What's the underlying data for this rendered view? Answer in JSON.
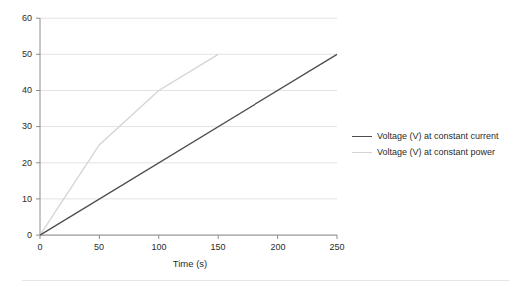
{
  "chart_data": {
    "type": "line",
    "title": "",
    "subtitle": "",
    "xlabel": "Time (s)",
    "ylabel": "",
    "xlim": [
      0,
      250
    ],
    "ylim": [
      0,
      60
    ],
    "xticks": [
      0,
      50,
      100,
      150,
      200,
      250
    ],
    "yticks": [
      0,
      10,
      20,
      30,
      40,
      50,
      60
    ],
    "grid": "horizontal",
    "legend_position": "right",
    "series": [
      {
        "name": "Voltage (V) at constant current",
        "color": "#4d4d4d",
        "x": [
          0,
          250
        ],
        "y": [
          0,
          50
        ]
      },
      {
        "name": "Voltage (V) at constant power",
        "color": "#d4d4d4",
        "x": [
          0,
          50,
          100,
          150
        ],
        "y": [
          0,
          25,
          40,
          50
        ]
      }
    ]
  },
  "axes": {
    "x_tick_labels": [
      "0",
      "50",
      "100",
      "150",
      "200",
      "250"
    ],
    "y_tick_labels": [
      "0",
      "10",
      "20",
      "30",
      "40",
      "50",
      "60"
    ],
    "x_title": "Time (s)"
  },
  "legend": {
    "entries": [
      {
        "label": "Voltage (V) at constant current",
        "color": "#4d4d4d"
      },
      {
        "label": "Voltage (V) at constant power",
        "color": "#d4d4d4"
      }
    ]
  },
  "style": {
    "background": "#ffffff",
    "gridline_color": "#e3e3e3",
    "axis_color": "#8c8c8c",
    "text_color": "#2b2b2b"
  }
}
